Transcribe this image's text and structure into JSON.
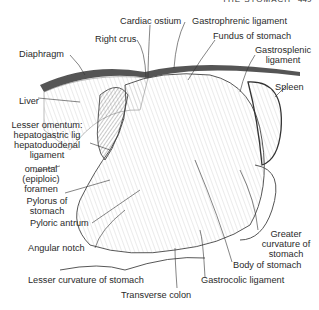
{
  "header": {
    "title": "THE STOMACH",
    "page": "449"
  },
  "labels": {
    "cardiac_ostium": "Cardiac ostium",
    "right_crus": "Right crus",
    "gastrophrenic_ligament": "Gastrophrenic ligament",
    "fundus": "Fundus of stomach",
    "gastrosplenic_1": "Gastrosplenic",
    "gastrosplenic_2": "ligament",
    "diaphragm": "Diaphragm",
    "spleen": "Spleen",
    "liver": "Liver",
    "lesser_omentum_1": "Lesser omentum:",
    "lesser_omentum_2": "hepatogastric lig",
    "lesser_omentum_3": "hepatoduodenal",
    "lesser_omentum_4": "ligament",
    "omental_1": "omental",
    "omental_2": "(epiploic)",
    "omental_3": "foramen",
    "pylorus_1": "Pylorus of",
    "pylorus_2": "stomach",
    "pyloric_antrum": "Pyloric antrum",
    "angular_notch": "Angular notch",
    "greater_curv_1": "Greater",
    "greater_curv_2": "curvature of",
    "greater_curv_3": "stomach",
    "body": "Body of stomach",
    "lesser_curvature": "Lesser curvature of stomach",
    "gastrocolic": "Gastrocolic ligament",
    "transverse_colon": "Transverse colon"
  }
}
